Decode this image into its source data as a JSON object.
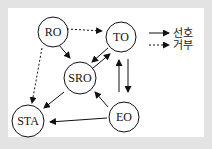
{
  "diagram": {
    "nodes": [
      {
        "id": "RO",
        "label": "RO",
        "x": 53,
        "y": 32
      },
      {
        "id": "TO",
        "label": "TO",
        "x": 121,
        "y": 37
      },
      {
        "id": "SRO",
        "label": "SRO",
        "x": 80,
        "y": 78
      },
      {
        "id": "STA",
        "label": "STA",
        "x": 27,
        "y": 121
      },
      {
        "id": "EO",
        "label": "EO",
        "x": 121,
        "y": 116
      }
    ],
    "edges": [
      {
        "from": "RO",
        "to": "TO",
        "style": "dashed"
      },
      {
        "from": "RO",
        "to": "SRO",
        "style": "solid"
      },
      {
        "from": "RO",
        "to": "STA",
        "style": "dashed"
      },
      {
        "from": "TO",
        "to": "SRO",
        "style": "solid"
      },
      {
        "from": "SRO",
        "to": "TO",
        "style": "solid"
      },
      {
        "from": "TO",
        "to": "EO",
        "style": "solid"
      },
      {
        "from": "EO",
        "to": "TO",
        "style": "solid"
      },
      {
        "from": "SRO",
        "to": "STA",
        "style": "solid"
      },
      {
        "from": "EO",
        "to": "SRO",
        "style": "solid"
      },
      {
        "from": "EO",
        "to": "STA",
        "style": "solid"
      }
    ],
    "legend": [
      {
        "style": "solid",
        "label": "선호"
      },
      {
        "style": "dashed",
        "label": "거부"
      }
    ]
  }
}
